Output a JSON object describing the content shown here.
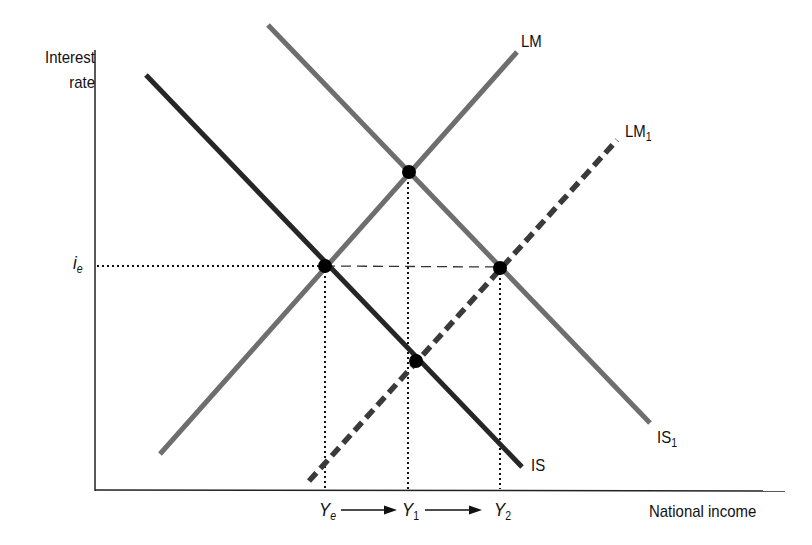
{
  "diagram": {
    "axes": {
      "y_label_line1": "Interest",
      "y_label_line2": "rate",
      "x_label": "National income",
      "y_tick": {
        "main": "i",
        "sub": "e"
      }
    },
    "curves": [
      {
        "id": "IS",
        "label": "IS",
        "sub": "",
        "style": "solid",
        "color": "#262626"
      },
      {
        "id": "IS1",
        "label": "IS",
        "sub": "1",
        "style": "solid",
        "color": "#6e6e6e"
      },
      {
        "id": "LM",
        "label": "LM",
        "sub": "",
        "style": "solid",
        "color": "#6e6e6e"
      },
      {
        "id": "LM1",
        "label": "LM",
        "sub": "1",
        "style": "dashed",
        "color": "#3a3a3a"
      }
    ],
    "x_ticks": [
      {
        "main": "Y",
        "sub": "e"
      },
      {
        "main": "Y",
        "sub": "1"
      },
      {
        "main": "Y",
        "sub": "2"
      }
    ],
    "equilibrium_points": [
      {
        "name": "IS-LM",
        "at": [
          "Ye",
          "ie"
        ]
      },
      {
        "name": "IS1-LM",
        "at": [
          "Y1",
          "above ie"
        ]
      },
      {
        "name": "IS1-LM1",
        "at": [
          "Y2",
          "ie"
        ]
      },
      {
        "name": "IS-LM1",
        "at": [
          "Y1",
          "below ie"
        ]
      }
    ],
    "arrows": [
      "Ye → Y1",
      "Y1 → Y2"
    ]
  }
}
